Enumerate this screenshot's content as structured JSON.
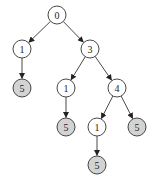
{
  "diagram": {
    "type": "tree",
    "node_radius": 9,
    "colors": {
      "leaf_fill": "#d3d3d3",
      "internal_fill": "#ffffff",
      "stroke": "#333333"
    },
    "nodes": [
      {
        "id": "n0",
        "label": "0",
        "x": 57,
        "y": 15,
        "shaded": false
      },
      {
        "id": "n1",
        "label": "1",
        "x": 22,
        "y": 49,
        "shaded": false
      },
      {
        "id": "n2",
        "label": "3",
        "x": 90,
        "y": 49,
        "shaded": false
      },
      {
        "id": "n3",
        "label": "5",
        "x": 22,
        "y": 88,
        "shaded": true
      },
      {
        "id": "n4",
        "label": "1",
        "x": 66,
        "y": 88,
        "shaded": false
      },
      {
        "id": "n5",
        "label": "4",
        "x": 117,
        "y": 88,
        "shaded": false
      },
      {
        "id": "n6",
        "label": "5",
        "x": 66,
        "y": 127,
        "shaded": true
      },
      {
        "id": "n7",
        "label": "1",
        "x": 97,
        "y": 127,
        "shaded": false
      },
      {
        "id": "n8",
        "label": "5",
        "x": 137,
        "y": 127,
        "shaded": true
      },
      {
        "id": "n9",
        "label": "5",
        "x": 97,
        "y": 165,
        "shaded": true
      }
    ],
    "edges": [
      {
        "from": "n0",
        "to": "n1"
      },
      {
        "from": "n0",
        "to": "n2"
      },
      {
        "from": "n1",
        "to": "n3"
      },
      {
        "from": "n2",
        "to": "n4"
      },
      {
        "from": "n2",
        "to": "n5"
      },
      {
        "from": "n4",
        "to": "n6"
      },
      {
        "from": "n5",
        "to": "n7"
      },
      {
        "from": "n5",
        "to": "n8"
      },
      {
        "from": "n7",
        "to": "n9"
      }
    ]
  }
}
